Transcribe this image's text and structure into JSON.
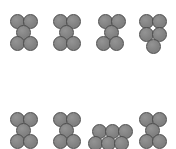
{
  "figure": {
    "type": "sphere-cluster-diagram",
    "width": 176,
    "height": 149,
    "background_color": "#ffffff",
    "sphere": {
      "diameter": 15,
      "fill_color": "#808080",
      "stroke_color": "#4d4d4d",
      "stroke_width": 1,
      "highlight_color": "#949494"
    },
    "rows": 2,
    "columns": 4,
    "total_clusters": 8,
    "note_bottom_row_clipped": true
  },
  "clusters": [
    {
      "id": "cluster-1",
      "row": 1,
      "column": 1,
      "shape": "x-pentomino",
      "sphere_count": 5,
      "origin": {
        "x": 10,
        "y": 14
      },
      "spheres": [
        {
          "x": 0,
          "y": 0
        },
        {
          "x": 13,
          "y": 0
        },
        {
          "x": 6,
          "y": 11
        },
        {
          "x": 0,
          "y": 22
        },
        {
          "x": 13,
          "y": 22
        }
      ]
    },
    {
      "id": "cluster-2",
      "row": 1,
      "column": 2,
      "shape": "x-pentomino",
      "sphere_count": 5,
      "origin": {
        "x": 53,
        "y": 14
      },
      "spheres": [
        {
          "x": 0,
          "y": 0
        },
        {
          "x": 13,
          "y": 0
        },
        {
          "x": 6,
          "y": 11
        },
        {
          "x": 0,
          "y": 22
        },
        {
          "x": 13,
          "y": 22
        }
      ]
    },
    {
      "id": "cluster-3",
      "row": 1,
      "column": 3,
      "shape": "x-pentomino",
      "sphere_count": 5,
      "origin": {
        "x": 96,
        "y": 14
      },
      "spheres": [
        {
          "x": 2,
          "y": 0
        },
        {
          "x": 15,
          "y": 0
        },
        {
          "x": 8,
          "y": 11
        },
        {
          "x": 0,
          "y": 22
        },
        {
          "x": 13,
          "y": 22
        }
      ]
    },
    {
      "id": "cluster-4",
      "row": 1,
      "column": 4,
      "shape": "two-two-one-pyramid",
      "sphere_count": 5,
      "origin": {
        "x": 139,
        "y": 14
      },
      "spheres": [
        {
          "x": 0,
          "y": 0
        },
        {
          "x": 13,
          "y": 0
        },
        {
          "x": 0,
          "y": 13
        },
        {
          "x": 13,
          "y": 13
        },
        {
          "x": 7,
          "y": 25
        }
      ]
    },
    {
      "id": "cluster-5",
      "row": 2,
      "column": 1,
      "shape": "x-pentomino",
      "sphere_count": 5,
      "origin": {
        "x": 10,
        "y": 112
      },
      "spheres": [
        {
          "x": 0,
          "y": 0
        },
        {
          "x": 13,
          "y": 0
        },
        {
          "x": 6,
          "y": 11
        },
        {
          "x": 0,
          "y": 22
        },
        {
          "x": 13,
          "y": 22
        }
      ]
    },
    {
      "id": "cluster-6",
      "row": 2,
      "column": 2,
      "shape": "x-pentomino",
      "sphere_count": 5,
      "origin": {
        "x": 53,
        "y": 112
      },
      "spheres": [
        {
          "x": 0,
          "y": 0
        },
        {
          "x": 13,
          "y": 0
        },
        {
          "x": 6,
          "y": 11
        },
        {
          "x": 0,
          "y": 22
        },
        {
          "x": 13,
          "y": 22
        }
      ]
    },
    {
      "id": "cluster-7",
      "row": 2,
      "column": 3,
      "shape": "three-over-three-row",
      "sphere_count": 6,
      "origin": {
        "x": 92,
        "y": 124
      },
      "spheres": [
        {
          "x": 0,
          "y": 0
        },
        {
          "x": 13,
          "y": 0
        },
        {
          "x": 26,
          "y": 0
        },
        {
          "x": -4,
          "y": 12
        },
        {
          "x": 9,
          "y": 12
        },
        {
          "x": 22,
          "y": 12
        }
      ]
    },
    {
      "id": "cluster-8",
      "row": 2,
      "column": 4,
      "shape": "x-pentomino",
      "sphere_count": 5,
      "origin": {
        "x": 139,
        "y": 112
      },
      "spheres": [
        {
          "x": 0,
          "y": 0
        },
        {
          "x": 13,
          "y": 0
        },
        {
          "x": 6,
          "y": 11
        },
        {
          "x": 0,
          "y": 22
        },
        {
          "x": 13,
          "y": 22
        }
      ]
    }
  ]
}
